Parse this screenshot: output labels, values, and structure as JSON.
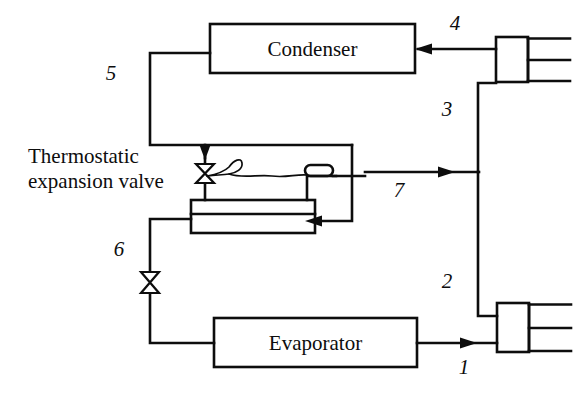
{
  "diagram": {
    "ink_color": "#0d0d0d",
    "background_color": "#ffffff",
    "components": {
      "condenser": {
        "label": "Condenser"
      },
      "evaporator": {
        "label": "Evaporator"
      },
      "expansion_valve": {
        "caption_line1": "Thermostatic",
        "caption_line2": "expansion valve"
      },
      "heat_exchanger": {
        "label": ""
      },
      "compressor_high": {
        "label": ""
      },
      "compressor_low": {
        "label": ""
      }
    },
    "stream_labels": [
      {
        "id": "1",
        "text": "1",
        "x": 464,
        "y": 374
      },
      {
        "id": "2",
        "text": "2",
        "x": 447,
        "y": 288
      },
      {
        "id": "3",
        "text": "3",
        "x": 447,
        "y": 116
      },
      {
        "id": "4",
        "text": "4",
        "x": 455,
        "y": 30
      },
      {
        "id": "5",
        "text": "5",
        "x": 111,
        "y": 80
      },
      {
        "id": "6",
        "text": "6",
        "x": 119,
        "y": 256
      },
      {
        "id": "7",
        "text": "7",
        "x": 399,
        "y": 197
      }
    ],
    "icon_names": [
      "expansion-valve-icon",
      "throttle-valve-icon",
      "capillary-tube-icon",
      "sensing-bulb-icon",
      "compressor-icon",
      "flow-arrow-icon"
    ]
  }
}
